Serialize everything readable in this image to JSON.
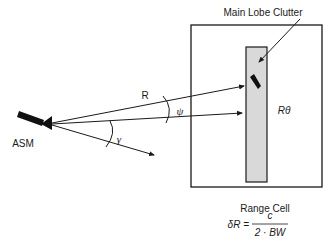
{
  "diagram": {
    "labels": {
      "main_lobe_clutter": "Main Lobe Clutter",
      "range": "R",
      "psi": "ψ",
      "gamma": "γ",
      "cross_range": "Rθ",
      "missile": "ASM",
      "range_cell_title": "Range Cell",
      "formula_lhs": "δR =",
      "formula_numerator": "c",
      "formula_denominator": "2 · BW"
    },
    "colors": {
      "line": "#1a1a1a",
      "clutter_strip": "#d9d9d9",
      "background": "#ffffff"
    }
  }
}
